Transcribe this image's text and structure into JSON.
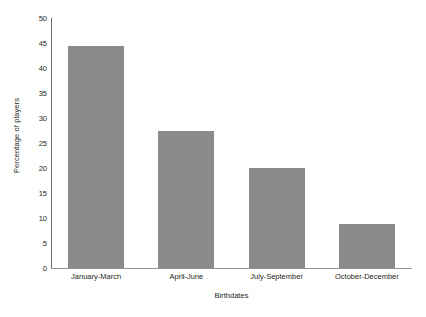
{
  "chart_data": {
    "type": "bar",
    "title": "",
    "subtitle": "",
    "xlabel": "Birthdates",
    "ylabel": "Percentage of players",
    "categories": [
      "January-March",
      "April-June",
      "July-September",
      "October-December"
    ],
    "values": [
      44.5,
      27.4,
      20.0,
      8.8
    ],
    "ylim": [
      0,
      50
    ],
    "ytick_step": 5,
    "ytick_labels": [
      "0",
      "5",
      "10",
      "15",
      "20",
      "25",
      "30",
      "35",
      "40",
      "45",
      "50"
    ],
    "grid": false,
    "legend": null,
    "legend_position": "none",
    "annotations": [],
    "bar_color": "#8a8a8a",
    "axis_color": "#6d6e71",
    "baseline_color": "#939598",
    "background_color": "#ffffff",
    "text_color": "#231f20"
  }
}
